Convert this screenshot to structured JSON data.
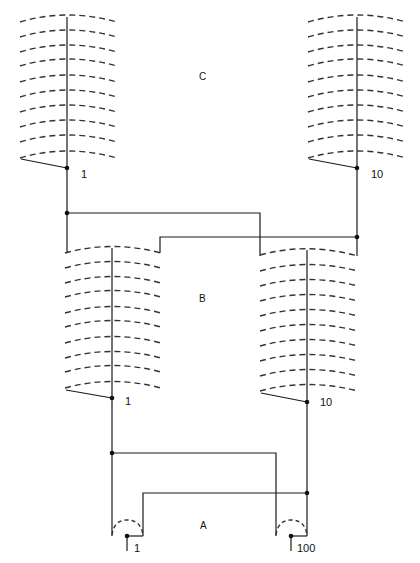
{
  "diagram": {
    "type": "circuit-schematic",
    "stage_labels": {
      "a": "A",
      "b": "B",
      "c": "C"
    },
    "stages": [
      {
        "id": "C",
        "coils": [
          {
            "position": "left",
            "terminal_label": "1",
            "rung_count": 10
          },
          {
            "position": "right",
            "terminal_label": "10",
            "rung_count": 10
          }
        ]
      },
      {
        "id": "B",
        "coils": [
          {
            "position": "left",
            "terminal_label": "1",
            "rung_count": 10
          },
          {
            "position": "right",
            "terminal_label": "10",
            "rung_count": 10
          }
        ]
      },
      {
        "id": "A",
        "contacts": [
          {
            "position": "left",
            "terminal_label": "1"
          },
          {
            "position": "right",
            "terminal_label": "100"
          }
        ]
      }
    ],
    "labels": {
      "c_left": "1",
      "c_right": "10",
      "b_left": "1",
      "b_right": "10",
      "a_left": "1",
      "a_right": "100"
    },
    "colors": {
      "ink": "#1a1a1a",
      "background": "#ffffff"
    }
  }
}
